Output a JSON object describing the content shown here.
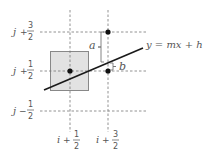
{
  "diagram": {
    "colors": {
      "line": "#1a1a1a",
      "dashed": "#777777",
      "box_fill": "#e2e2e2",
      "box_stroke": "#888888",
      "dot": "#111111",
      "text": "#555555"
    },
    "row_labels": [
      {
        "var": "j",
        "op": "+",
        "num": "3",
        "den": "2"
      },
      {
        "var": "j",
        "op": "+",
        "num": "1",
        "den": "2"
      },
      {
        "var": "j",
        "op": "−",
        "num": "1",
        "den": "2"
      }
    ],
    "col_labels": [
      {
        "var": "i",
        "op": "+",
        "num": "1",
        "den": "2"
      },
      {
        "var": "i",
        "op": "+",
        "num": "3",
        "den": "2"
      }
    ],
    "equation": "y = mx + h",
    "bracket_a_label": "a",
    "bracket_b_label": "b"
  }
}
